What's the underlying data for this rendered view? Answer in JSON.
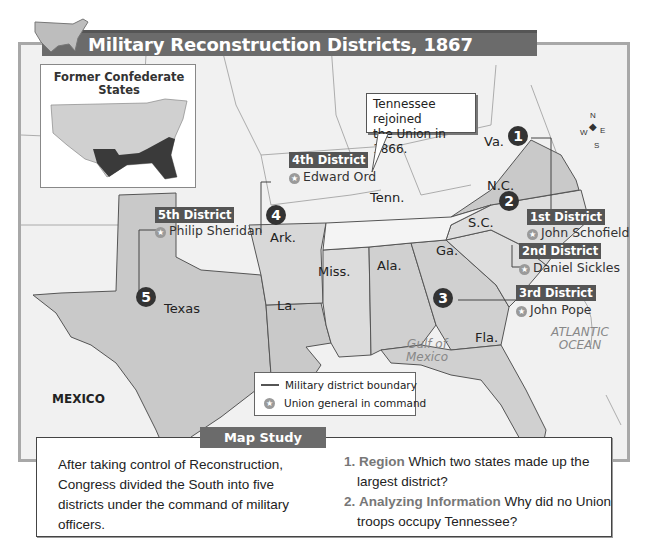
{
  "title": "Military Reconstruction Districts, 1867",
  "inset": {
    "title_line1": "Former Confederate",
    "title_line2": "States"
  },
  "callout": {
    "line1": "Tennessee rejoined",
    "line2": "the Union in 1866."
  },
  "states": {
    "va": "Va.",
    "nc": "N.C.",
    "sc": "S.C.",
    "ga": "Ga.",
    "fla": "Fla.",
    "ala": "Ala.",
    "miss": "Miss.",
    "la": "La.",
    "ark": "Ark.",
    "tenn": "Tenn.",
    "texas": "Texas"
  },
  "districts": [
    {
      "number": "1",
      "name": "1st District",
      "general": "John Schofield"
    },
    {
      "number": "2",
      "name": "2nd District",
      "general": "Daniel Sickles"
    },
    {
      "number": "3",
      "name": "3rd District",
      "general": "John Pope"
    },
    {
      "number": "4",
      "name": "4th District",
      "general": "Edward Ord"
    },
    {
      "number": "5",
      "name": "5th District",
      "general": "Philip Sheridan"
    }
  ],
  "places": {
    "mexico": "MEXICO",
    "gulf_line1": "Gulf of",
    "gulf_line2": "Mexico",
    "atlantic_line1": "ATLANTIC",
    "atlantic_line2": "OCEAN"
  },
  "compass": {
    "n": "N",
    "s": "S",
    "e": "E",
    "w": "W"
  },
  "legend": {
    "boundary": "Military district boundary",
    "general": "Union general in command"
  },
  "map_study": {
    "heading": "Map Study",
    "summary": "After taking control of Reconstruction, Congress divided the South into five districts under the command of military officers.",
    "questions": [
      {
        "number": "1.",
        "label": "Region",
        "text": "Which two states made up the largest district?"
      },
      {
        "number": "2.",
        "label": "Analyzing Information",
        "text": "Why did no Union troops occupy Tennessee?"
      }
    ]
  },
  "colors": {
    "confederate_fill": "#c9c9c9",
    "background": "#f1f1f1",
    "header": "#6b6b6b",
    "tag": "#555555"
  }
}
